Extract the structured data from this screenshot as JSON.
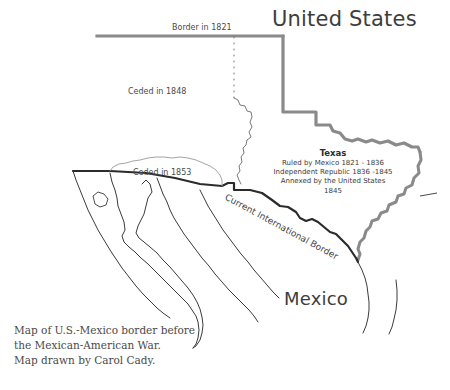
{
  "map": {
    "title_us": "United States",
    "title_mexico": "Mexico",
    "labels": {
      "border_1821": "Border in 1821",
      "ceded_1848": "Ceded in 1848",
      "ceded_1853": "Ceded in 1853",
      "current_border": "Current International Border"
    },
    "texas": {
      "name": "Texas",
      "line1": "Ruled by Mexico 1821 - 1836",
      "line2": "Independent Republic 1836 -1845",
      "line3": "Annexed by the United States 1845"
    },
    "caption": {
      "line1": "Map of U.S.-Mexico border before",
      "line2": "the Mexican-American War.",
      "line3": "Map drawn by Carol Cady."
    },
    "colors": {
      "background": "#ffffff",
      "thick_gray_border": "#808080",
      "thin_outline": "#3a3a3a",
      "cession_outline": "#9a9a9a",
      "text": "#3a3a3a",
      "heading_text": "#3d3d3d"
    }
  }
}
